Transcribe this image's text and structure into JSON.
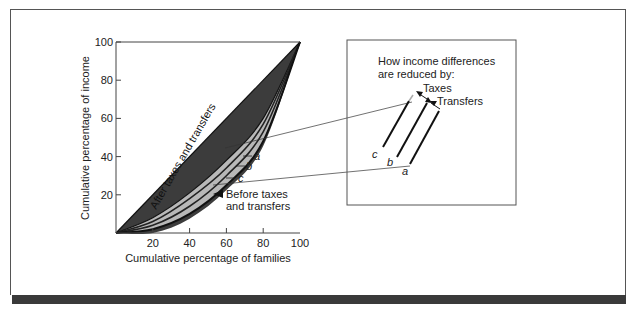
{
  "chart_data": {
    "type": "area",
    "xlabel": "Cumulative percentage of families",
    "ylabel": "Cumulative percentage of income",
    "xlim": [
      0,
      100
    ],
    "ylim": [
      0,
      100
    ],
    "x_ticks": [
      "20",
      "40",
      "60",
      "80",
      "100"
    ],
    "y_ticks": [
      "20",
      "40",
      "60",
      "80",
      "100"
    ],
    "grid": false,
    "series": [
      {
        "name": "Line of equality",
        "x": [
          0,
          100
        ],
        "y": [
          0,
          100
        ]
      },
      {
        "name": "a (after taxes and transfers)",
        "x": [
          0,
          20,
          40,
          60,
          80,
          100
        ],
        "y": [
          0,
          8,
          21,
          38,
          60,
          100
        ]
      },
      {
        "name": "b",
        "x": [
          0,
          20,
          40,
          60,
          80,
          100
        ],
        "y": [
          0,
          6,
          18,
          34,
          57,
          100
        ]
      },
      {
        "name": "c",
        "x": [
          0,
          20,
          40,
          60,
          80,
          100
        ],
        "y": [
          0,
          4,
          14,
          30,
          53,
          100
        ]
      },
      {
        "name": "Before taxes and transfers",
        "x": [
          0,
          20,
          40,
          60,
          80,
          100
        ],
        "y": [
          0,
          2,
          10,
          25,
          48,
          100
        ]
      }
    ],
    "annotations": [
      "After taxes and transfers",
      "Before taxes and transfers",
      "a",
      "b",
      "c"
    ]
  },
  "plot": {
    "region_label": "After taxes and transfers",
    "before_label_line1": "Before taxes",
    "before_label_line2": "and transfers",
    "curve_labels": {
      "a": "a",
      "b": "b",
      "c": "c"
    }
  },
  "inset": {
    "title_line1": "How income differences",
    "title_line2": "are reduced by:",
    "taxes_label": "Taxes",
    "transfers_label": "Transfers",
    "line_labels": {
      "a": "a",
      "b": "b",
      "c": "c"
    }
  },
  "colors": {
    "dark_fill": "#3c3c3c",
    "band_fill": "#b8b8b8",
    "line": "#111111",
    "frame": "#555555",
    "bar": "#3a3a3a"
  }
}
